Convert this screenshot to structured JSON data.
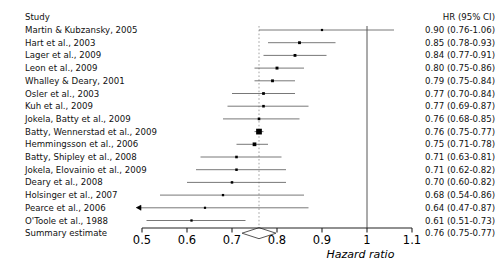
{
  "columns": {
    "study_header": "Study",
    "hr_header": "HR (95% CI)"
  },
  "axis": {
    "title": "Hazard ratio",
    "ticks": [
      0.5,
      0.6,
      0.7,
      0.8,
      0.9,
      1.0,
      1.1
    ],
    "tick_labels": [
      "0.5",
      "0.6",
      "0.7",
      "0.8",
      "0.9",
      "1",
      "1.1"
    ],
    "min": 0.5,
    "max": 1.1,
    "reference_line": 1.0,
    "summary_line": 0.76
  },
  "colors": {
    "marker": "#000000",
    "line": "#555555",
    "axis": "#222222",
    "text": "#111111",
    "reference": "#444444",
    "summary_dashed": "#999999"
  },
  "chart_data": {
    "type": "forest",
    "title": "",
    "xlabel": "Hazard ratio",
    "ylabel": "",
    "xlim": [
      0.5,
      1.1
    ],
    "reference_line": 1.0,
    "summary_line": 0.76,
    "grid": false,
    "legend": "none",
    "columns": [
      "Study",
      "HR (95% CI)"
    ],
    "rows": [
      {
        "study": "Martin & Kubzansky, 2005",
        "hr": 0.9,
        "lcl": 0.76,
        "ucl": 1.06,
        "label": "0.90 (0.76-1.06)",
        "weight": 0.35,
        "clipped_left": false
      },
      {
        "study": "Hart et al., 2003",
        "hr": 0.85,
        "lcl": 0.78,
        "ucl": 0.93,
        "label": "0.85 (0.78-0.93)",
        "weight": 0.7,
        "clipped_left": false
      },
      {
        "study": "Lager et al., 2009",
        "hr": 0.84,
        "lcl": 0.77,
        "ucl": 0.91,
        "label": "0.84 (0.77-0.91)",
        "weight": 0.7,
        "clipped_left": false
      },
      {
        "study": "Leon et al., 2009",
        "hr": 0.8,
        "lcl": 0.75,
        "ucl": 0.86,
        "label": "0.80 (0.75-0.86)",
        "weight": 0.75,
        "clipped_left": false
      },
      {
        "study": "Whalley & Deary, 2001",
        "hr": 0.79,
        "lcl": 0.75,
        "ucl": 0.84,
        "label": "0.79 (0.75-0.84)",
        "weight": 0.7,
        "clipped_left": false
      },
      {
        "study": "Osler et al., 2003",
        "hr": 0.77,
        "lcl": 0.7,
        "ucl": 0.84,
        "label": "0.77 (0.70-0.84)",
        "weight": 0.65,
        "clipped_left": false
      },
      {
        "study": "Kuh et al., 2009",
        "hr": 0.77,
        "lcl": 0.69,
        "ucl": 0.87,
        "label": "0.77 (0.69-0.87)",
        "weight": 0.55,
        "clipped_left": false
      },
      {
        "study": "Jokela, Batty et al., 2009",
        "hr": 0.76,
        "lcl": 0.68,
        "ucl": 0.85,
        "label": "0.76 (0.68-0.85)",
        "weight": 0.55,
        "clipped_left": false
      },
      {
        "study": "Batty, Wennerstad et al., 2009",
        "hr": 0.76,
        "lcl": 0.75,
        "ucl": 0.77,
        "label": "0.76 (0.75-0.77)",
        "weight": 3.2,
        "clipped_left": false
      },
      {
        "study": "Hemmingsson et al., 2006",
        "hr": 0.75,
        "lcl": 0.71,
        "ucl": 0.78,
        "label": "0.75 (0.71-0.78)",
        "weight": 1.3,
        "clipped_left": false
      },
      {
        "study": "Batty, Shipley et al., 2008",
        "hr": 0.71,
        "lcl": 0.63,
        "ucl": 0.81,
        "label": "0.71 (0.63-0.81)",
        "weight": 0.55,
        "clipped_left": false
      },
      {
        "study": "Jokela, Elovainio et al., 2009",
        "hr": 0.71,
        "lcl": 0.62,
        "ucl": 0.82,
        "label": "0.71 (0.62-0.82)",
        "weight": 0.5,
        "clipped_left": false
      },
      {
        "study": "Deary et al., 2008",
        "hr": 0.7,
        "lcl": 0.6,
        "ucl": 0.82,
        "label": "0.70 (0.60-0.82)",
        "weight": 0.5,
        "clipped_left": false
      },
      {
        "study": "Holsinger et al., 2007",
        "hr": 0.68,
        "lcl": 0.54,
        "ucl": 0.86,
        "label": "0.68 (0.54-0.86)",
        "weight": 0.4,
        "clipped_left": false
      },
      {
        "study": "Pearce et al., 2006",
        "hr": 0.64,
        "lcl": 0.47,
        "ucl": 0.87,
        "label": "0.64 (0.47-0.87)",
        "weight": 0.35,
        "clipped_left": true
      },
      {
        "study": "O'Toole et al., 1988",
        "hr": 0.61,
        "lcl": 0.51,
        "ucl": 0.73,
        "label": "0.61 (0.51-0.73)",
        "weight": 0.4,
        "clipped_left": false
      }
    ],
    "summary": {
      "study": "Summary estimate",
      "hr": 0.76,
      "lcl": 0.75,
      "ucl": 0.77,
      "label": "0.76 (0.75-0.77)"
    }
  }
}
